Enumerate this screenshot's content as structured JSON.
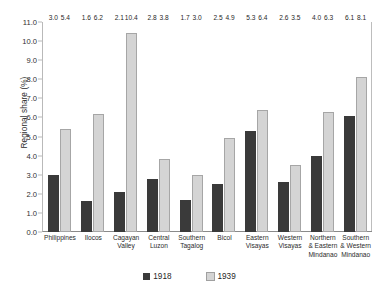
{
  "chart_data": {
    "type": "bar",
    "title": "",
    "xlabel": "",
    "ylabel": "Regional share (%)",
    "ylim": [
      0.0,
      11.0
    ],
    "ytick_step": 1.0,
    "yticks": [
      "11.0",
      "10.0",
      "9.0",
      "8.0",
      "7.0",
      "6.0",
      "5.0",
      "4.0",
      "3.0",
      "2.0",
      "1.0",
      "0.0"
    ],
    "grid": false,
    "legend_position": "bottom",
    "categories": [
      "Philippines",
      "Ilocos",
      "Cagayan Valley",
      "Central Luzon",
      "Southern Tagalog",
      "Bicol",
      "Eastern Visayas",
      "Western Visayas",
      "Northern & Eastern Mindanao",
      "Southern & Western Mindanao"
    ],
    "category_lines": [
      [
        "Philippines"
      ],
      [
        "Ilocos"
      ],
      [
        "Cagayan",
        "Valley"
      ],
      [
        "Central",
        "Luzon"
      ],
      [
        "Southern",
        "Tagalog"
      ],
      [
        "Bicol"
      ],
      [
        "Eastern",
        "Visayas"
      ],
      [
        "Western",
        "Visayas"
      ],
      [
        "Northern",
        "& Eastern",
        "Mindanao"
      ],
      [
        "Southern",
        "& Western",
        "Mindanao"
      ]
    ],
    "series": [
      {
        "name": "1918",
        "color": "#3a3a3a",
        "values": [
          3.0,
          1.6,
          2.1,
          2.8,
          1.7,
          2.5,
          5.3,
          2.6,
          4.0,
          6.1
        ],
        "labels": [
          "3.0",
          "1.6",
          "2.1",
          "2.8",
          "1.7",
          "2.5",
          "5.3",
          "2.6",
          "4.0",
          "6.1"
        ]
      },
      {
        "name": "1939",
        "color": "#d4d4d4",
        "values": [
          5.4,
          6.2,
          10.4,
          3.8,
          3.0,
          4.9,
          6.4,
          3.5,
          6.3,
          8.1
        ],
        "labels": [
          "5.4",
          "6.2",
          "10.4",
          "3.8",
          "3.0",
          "4.9",
          "6.4",
          "3.5",
          "6.3",
          "8.1"
        ]
      }
    ]
  },
  "legend": {
    "items": [
      {
        "label": "1918"
      },
      {
        "label": "1939"
      }
    ]
  }
}
